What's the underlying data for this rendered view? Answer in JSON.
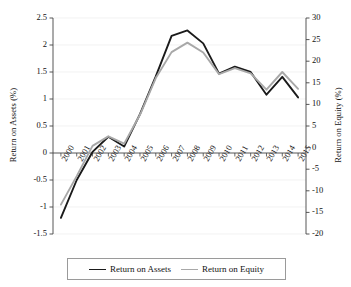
{
  "chart_data": {
    "type": "line",
    "title": "",
    "xlabel": "",
    "categories": [
      "2000",
      "2001",
      "2002",
      "2003",
      "2004",
      "2005",
      "2006",
      "2007",
      "2008",
      "2009",
      "2010",
      "2011",
      "2012",
      "2013",
      "2014",
      "2015"
    ],
    "grid": true,
    "legend_position": "bottom",
    "axes": {
      "left": {
        "label": "Return on Assets (%)",
        "ylim": [
          -1.5,
          2.5
        ],
        "ticks": [
          "2.5",
          "2",
          "1.5",
          "1",
          "0.5",
          "0",
          "-0.5",
          "-1",
          "-1.5"
        ],
        "tick_values": [
          2.5,
          2,
          1.5,
          1,
          0.5,
          0,
          -0.5,
          -1,
          -1.5
        ]
      },
      "right": {
        "label": "Return on Equity (%)",
        "ylim": [
          -20,
          30
        ],
        "ticks": [
          "30",
          "25",
          "20",
          "15",
          "10",
          "5",
          "0",
          "-5",
          "-10",
          "-15",
          "-20"
        ],
        "tick_values": [
          30,
          25,
          20,
          15,
          10,
          5,
          0,
          -5,
          -10,
          -15,
          -20
        ]
      }
    },
    "series": [
      {
        "name": "Return on Assets",
        "axis": "left",
        "color": "#1a1a1a",
        "width": 1.9,
        "values": [
          -1.2,
          -0.5,
          0.02,
          0.3,
          0.12,
          0.72,
          1.42,
          2.17,
          2.27,
          2.03,
          1.47,
          1.6,
          1.5,
          1.08,
          1.41,
          1.03
        ]
      },
      {
        "name": "Return on Equity",
        "axis": "right",
        "color": "#a8a8a8",
        "width": 1.9,
        "values": [
          -13.2,
          -6.6,
          0.4,
          2.6,
          0.9,
          7.6,
          16.1,
          22.1,
          24.3,
          22.0,
          17.0,
          18.4,
          17.2,
          13.4,
          17.5,
          13.6
        ]
      }
    ]
  },
  "legend": {
    "entries": [
      {
        "label": "Return on Assets",
        "color": "#1a1a1a"
      },
      {
        "label": "Return on Equity",
        "color": "#a8a8a8"
      }
    ]
  }
}
